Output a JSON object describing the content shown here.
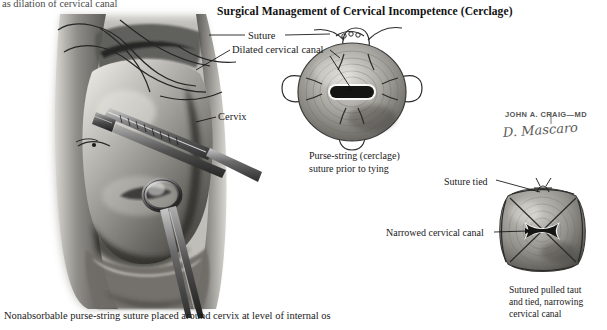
{
  "plate": {
    "title": "Surgical Management of Cervical Incompetence (Cerclage)",
    "cut_off_header": "as dilation of cervical canal",
    "bottom_caption": "Nonabsorbable purse-string suture placed around cervix at level of internal os"
  },
  "labels": {
    "suture": "Suture",
    "dilated_cervical_canal": "Dilated cervical canal",
    "cervix": "Cervix",
    "suture_tied": "Suture tied",
    "narrowed_cervical_canal": "Narrowed cervical canal"
  },
  "captions": {
    "middle_figure": "Purse-string (cerclage)\nsuture prior to tying",
    "lower_right_figure": "Sutured pulled taut\nand tied, narrowing\ncervical canal"
  },
  "credit": {
    "artist_printed": "JOHN A. CRAIG—MD",
    "artist_signature": "D. Mascaro"
  },
  "palette": {
    "background": "#ffffff",
    "ink": "#1a1a1a",
    "tissue_mid": "#9a9a96",
    "tissue_dark": "#4b4b49",
    "tissue_light": "#d8d6d1",
    "canal_dark": "#161616",
    "suture_line": "#2b2b2b",
    "instrument_steel": "#6e6e6e",
    "caption_gray": "#4a4a4a"
  },
  "figures": {
    "main": {
      "name": "vaginal-speculum-view-of-cervix",
      "description": "Grayscale wash drawing: cervix exposed in vagina, needle holder and ring forceps grasping cervix, nonabsorbable suture passing around cervix"
    },
    "middle": {
      "name": "cervix-cross-section-untied",
      "description": "Round cervix cross section with dilated slit-shaped canal and four purse-string suture bites"
    },
    "lower_right": {
      "name": "cervix-cross-section-tied",
      "description": "Cervix cross section drawn inward to a rounded square, suture tied taut, canal narrowed to an X-shaped slit"
    }
  }
}
